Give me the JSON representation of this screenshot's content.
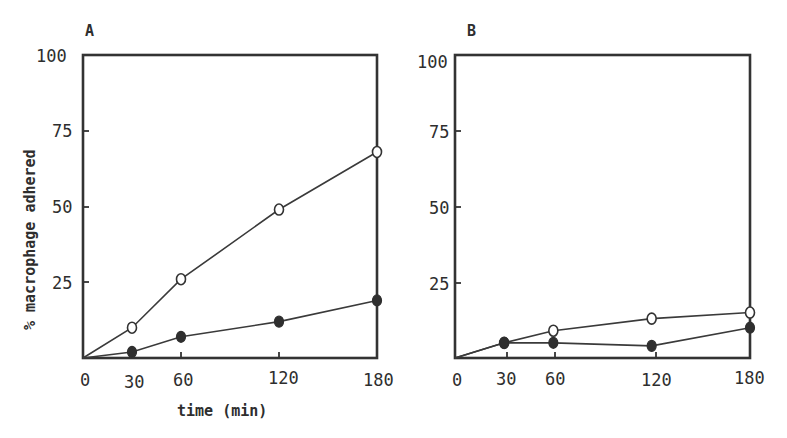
{
  "figure": {
    "ylabel": "% macrophage adhered",
    "xlabel": "time (min)"
  },
  "panels": [
    {
      "id": "A",
      "letter": "A",
      "y_tick_labels": [
        "100",
        "75",
        "50",
        "25"
      ],
      "x_tick_labels": [
        "0",
        "30",
        "60",
        "120",
        "180"
      ]
    },
    {
      "id": "B",
      "letter": "B",
      "y_tick_labels": [
        "100",
        "75",
        "50",
        "25"
      ],
      "x_tick_labels": [
        "0",
        "30",
        "60",
        "120",
        "180"
      ]
    }
  ],
  "chart_data": [
    {
      "type": "line",
      "title": "A",
      "xlabel": "time (min)",
      "ylabel": "% macrophage adhered",
      "x": [
        0,
        30,
        60,
        120,
        180
      ],
      "xlim": [
        0,
        180
      ],
      "ylim": [
        0,
        100
      ],
      "x_ticks": [
        0,
        30,
        60,
        120,
        180
      ],
      "y_ticks": [
        25,
        50,
        75,
        100
      ],
      "grid": false,
      "legend": null,
      "series": [
        {
          "name": "open circles",
          "marker": "open-circle",
          "values": [
            0,
            10,
            26,
            49,
            68
          ]
        },
        {
          "name": "filled circles",
          "marker": "filled-circle",
          "values": [
            0,
            2,
            7,
            12,
            19
          ]
        }
      ]
    },
    {
      "type": "line",
      "title": "B",
      "xlabel": "time (min)",
      "ylabel": "% macrophage adhered",
      "x": [
        0,
        30,
        60,
        120,
        180
      ],
      "xlim": [
        0,
        180
      ],
      "ylim": [
        0,
        100
      ],
      "x_ticks": [
        0,
        30,
        60,
        120,
        180
      ],
      "y_ticks": [
        25,
        50,
        75,
        100
      ],
      "grid": false,
      "legend": null,
      "series": [
        {
          "name": "open circles",
          "marker": "open-circle",
          "values": [
            0,
            5,
            9,
            13,
            15
          ]
        },
        {
          "name": "filled circles",
          "marker": "filled-circle",
          "values": [
            0,
            5,
            5,
            4,
            10
          ]
        }
      ]
    }
  ]
}
